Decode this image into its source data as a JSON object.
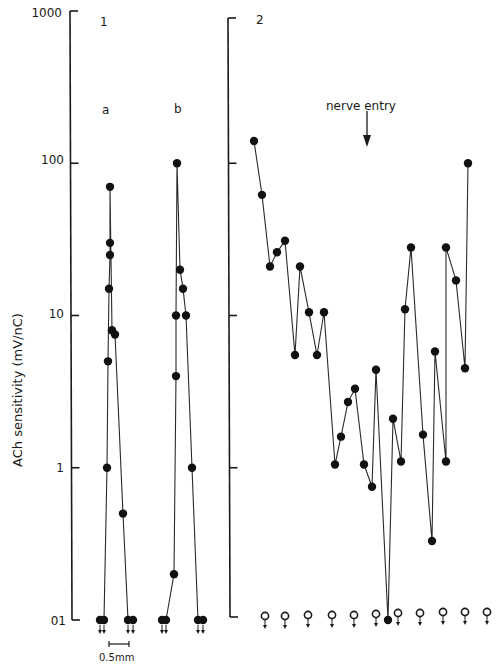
{
  "chart_data": [
    {
      "type": "line",
      "panel": "1",
      "title": "1",
      "ylabel": "ACh sensitivity (mV/nC)",
      "yscale": "log",
      "ylim": [
        0.1,
        1000
      ],
      "yticks": [
        0.1,
        1,
        10,
        100,
        1000
      ],
      "ytick_labels": [
        "01",
        "1",
        "10",
        "100",
        "1000"
      ],
      "scale_bar": "0.5mm",
      "series": [
        {
          "name": "a",
          "note": "ACh sensitivity along fibre a; points at 0.1 are below detection (arrows)",
          "points": [
            {
              "pos": 0,
              "value": 0.1,
              "below_detection": true
            },
            {
              "pos": 1,
              "value": 0.1,
              "below_detection": true
            },
            {
              "pos": 2,
              "value": 1.0
            },
            {
              "pos": 3,
              "value": 5.0
            },
            {
              "pos": 4,
              "value": 15
            },
            {
              "pos": 5,
              "value": 25
            },
            {
              "pos": 6,
              "value": 30
            },
            {
              "pos": 7,
              "value": 70
            },
            {
              "pos": 8,
              "value": 8
            },
            {
              "pos": 9,
              "value": 7.5
            },
            {
              "pos": 10,
              "value": 0.5
            },
            {
              "pos": 11,
              "value": 0.1,
              "below_detection": true
            },
            {
              "pos": 12,
              "value": 0.1,
              "below_detection": true
            }
          ]
        },
        {
          "name": "b",
          "note": "ACh sensitivity along fibre b",
          "points": [
            {
              "pos": 0,
              "value": 0.1,
              "below_detection": true
            },
            {
              "pos": 1,
              "value": 0.1,
              "below_detection": true
            },
            {
              "pos": 2,
              "value": 0.2
            },
            {
              "pos": 3,
              "value": 4
            },
            {
              "pos": 4,
              "value": 10
            },
            {
              "pos": 5,
              "value": 100
            },
            {
              "pos": 6,
              "value": 20
            },
            {
              "pos": 7,
              "value": 15
            },
            {
              "pos": 8,
              "value": 10
            },
            {
              "pos": 9,
              "value": 1.0
            },
            {
              "pos": 10,
              "value": 0.1,
              "below_detection": true
            },
            {
              "pos": 11,
              "value": 0.1,
              "below_detection": true
            }
          ]
        }
      ]
    },
    {
      "type": "line",
      "panel": "2",
      "title": "2",
      "yscale": "log",
      "ylim": [
        0.1,
        1000
      ],
      "annotation": "nerve entry",
      "series": [
        {
          "name": "2",
          "values": [
            140,
            62,
            21,
            26,
            31,
            5.5,
            21,
            10.5,
            5.5,
            10.5,
            1.05,
            1.6,
            2.7,
            3.3,
            1.05,
            0.75,
            4.4,
            0.1,
            2.1,
            1.1,
            11,
            28,
            1.65,
            0.33,
            5.8,
            1.1,
            28,
            17,
            4.5,
            100
          ],
          "below_detection_positions": 12
        }
      ]
    }
  ],
  "labels": {
    "ylabel": "ACh sensitivity (mV/nC)",
    "panel1": "1",
    "panel2": "2",
    "sub_a": "a",
    "sub_b": "b",
    "nerve_entry": "nerve entry",
    "scale_bar": "0.5mm",
    "ticks": [
      "1000",
      "100",
      "10",
      "1",
      "01"
    ]
  },
  "layout": {
    "panel1_axis_x": 70,
    "panel2_axis_x": 233,
    "y_top": 11,
    "y_bottom": 620,
    "px_per_decade": 152.25,
    "panel1a_x": [
      100,
      104,
      107,
      108,
      109,
      110,
      110,
      110,
      112,
      115,
      123,
      128,
      133
    ],
    "panel1b_x": [
      162,
      166,
      174,
      176,
      176,
      177,
      180,
      183,
      186,
      192,
      198,
      203
    ],
    "panel2_x": [
      254,
      262,
      270,
      277,
      285,
      295,
      300,
      309,
      317,
      324,
      335,
      341,
      348,
      355,
      364,
      372,
      376,
      388,
      393,
      401,
      405,
      411,
      423,
      432,
      435,
      446,
      446,
      456,
      465,
      468
    ],
    "open_circle_x": [
      265,
      285,
      308,
      332,
      354,
      376,
      398,
      420,
      443,
      465,
      487
    ],
    "open_circle_y": [
      616,
      616,
      615,
      615,
      615,
      614,
      613,
      613,
      612,
      612,
      612
    ]
  }
}
